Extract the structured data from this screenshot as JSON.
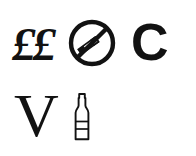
{
  "canvas": {
    "width": 196,
    "height": 156,
    "background_color": "#ffffff",
    "ink_color": "#121212"
  },
  "rows": [
    {
      "name": "top-row",
      "items": [
        {
          "kind": "text",
          "icon_name": "pound-sterling-pair",
          "text": "££",
          "meaning": "pound sterling currency symbol, shown twice"
        },
        {
          "kind": "icon",
          "icon_name": "no-smoking-icon",
          "text": "",
          "meaning": "no smoking / smoking prohibited"
        },
        {
          "kind": "text",
          "icon_name": "letter-c",
          "text": "C",
          "meaning": "capital letter C"
        }
      ]
    },
    {
      "name": "bottom-row",
      "items": [
        {
          "kind": "text",
          "icon_name": "letter-v",
          "text": "V",
          "meaning": "capital letter V"
        },
        {
          "kind": "icon",
          "icon_name": "bottle-icon",
          "text": "",
          "meaning": "bottle outline with label bands"
        }
      ]
    }
  ]
}
